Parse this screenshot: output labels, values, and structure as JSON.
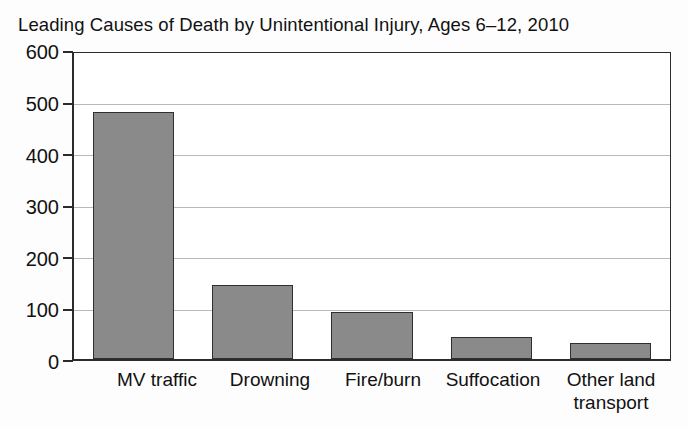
{
  "chart_data": {
    "type": "bar",
    "title": "Leading Causes of Death by Unintentional Injury, Ages 6–12, 2010",
    "xlabel": "",
    "ylabel": "",
    "categories": [
      "MV traffic",
      "Drowning",
      "Fire/burn",
      "Suffocation",
      "Other land transport"
    ],
    "values": [
      485,
      145,
      93,
      44,
      31
    ],
    "ylim": [
      0,
      600
    ],
    "ytick_labels": [
      "600",
      "500",
      "400",
      "300",
      "200",
      "100",
      "0"
    ],
    "ytick_values": [
      600,
      500,
      400,
      300,
      200,
      100,
      0
    ],
    "grid": "horizontal",
    "legend": "none",
    "bar_color": "#8a8a8a",
    "bar_edge_color": "#2f2f2f",
    "axis_color": "#2b2b2b",
    "grid_color": "#b9b9b9",
    "background_color": "#ffffff"
  },
  "axis": {
    "y": {
      "ticks": [
        {
          "label": "600",
          "value": 600
        },
        {
          "label": "500",
          "value": 500
        },
        {
          "label": "400",
          "value": 400
        },
        {
          "label": "300",
          "value": 300
        },
        {
          "label": "200",
          "value": 200
        },
        {
          "label": "100",
          "value": 100
        },
        {
          "label": "0",
          "value": 0
        }
      ]
    },
    "x": {
      "categories": [
        {
          "label": "MV traffic",
          "line1": "MV traffic",
          "line2": ""
        },
        {
          "label": "Drowning",
          "line1": "Drowning",
          "line2": ""
        },
        {
          "label": "Fire/burn",
          "line1": "Fire/burn",
          "line2": ""
        },
        {
          "label": "Suffocation",
          "line1": "Suffocation",
          "line2": ""
        },
        {
          "label": "Other land transport",
          "line1": "Other land",
          "line2": "transport"
        }
      ]
    }
  }
}
